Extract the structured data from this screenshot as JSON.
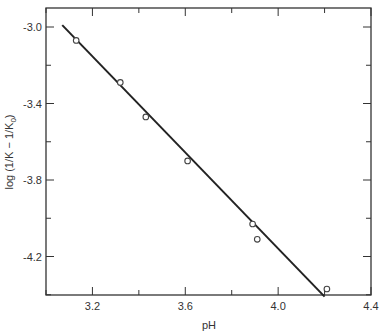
{
  "chart_data": {
    "type": "scatter",
    "title": "",
    "xlabel": "pH",
    "ylabel": "log (1/K − 1/K₀)",
    "xlim": [
      3.0,
      4.4
    ],
    "ylim": [
      -4.45,
      -2.9
    ],
    "x_ticks": [
      3.2,
      3.6,
      4.0,
      4.4
    ],
    "x_tick_labels": [
      "3.2",
      "3.6",
      "4.0",
      "4.4"
    ],
    "y_ticks": [
      -3.0,
      -3.4,
      -3.8,
      -4.2
    ],
    "y_tick_labels": [
      "-3.0",
      "-3.4",
      "-3.8",
      "-4.2"
    ],
    "grid": false,
    "legend": null,
    "series": [
      {
        "name": "data",
        "marker": "open-circle",
        "x": [
          3.13,
          3.32,
          3.43,
          3.61,
          3.89,
          3.91,
          4.21
        ],
        "y": [
          -3.07,
          -3.29,
          -3.47,
          -3.7,
          -4.03,
          -4.11,
          -4.37
        ]
      },
      {
        "name": "fit line",
        "marker": "line",
        "x": [
          3.07,
          4.2
        ],
        "y": [
          -2.99,
          -4.41
        ]
      }
    ]
  },
  "labels": {
    "xlabel": "pH",
    "ylabel_main": "log (1/K − 1/K",
    "ylabel_sub": "0",
    "ylabel_end": ")"
  },
  "colors": {
    "axis": "#333333",
    "line": "#222222",
    "marker": "#444444"
  }
}
